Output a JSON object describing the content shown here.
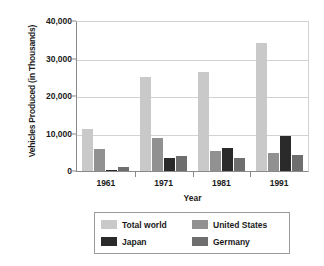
{
  "chart_data": {
    "type": "bar",
    "title": "",
    "xlabel": "Year",
    "ylabel": "Vehicles Produced (in Thousands)",
    "categories": [
      "1961",
      "1971",
      "1981",
      "1991"
    ],
    "ylim": [
      0,
      40000
    ],
    "yticks": [
      "0",
      "10,000",
      "20,000",
      "30,000",
      "40,000"
    ],
    "ytick_values": [
      0,
      10000,
      20000,
      30000,
      40000
    ],
    "grid": true,
    "legend_position": "bottom",
    "series": [
      {
        "name": "Total world",
        "color": "#c9c9c9",
        "values": [
          11300,
          25200,
          26400,
          34200
        ]
      },
      {
        "name": "United States",
        "color": "#919191",
        "values": [
          5900,
          8800,
          5300,
          4900
        ]
      },
      {
        "name": "Japan",
        "color": "#2a2a2a",
        "values": [
          250,
          3600,
          6200,
          9400
        ]
      },
      {
        "name": "Germany",
        "color": "#6e6e6e",
        "values": [
          1200,
          3900,
          3500,
          4200
        ]
      }
    ]
  }
}
